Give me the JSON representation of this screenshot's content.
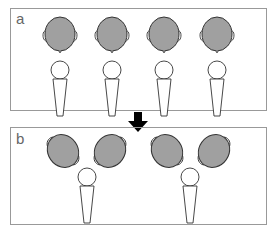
{
  "panels": [
    {
      "label": "a",
      "description": "Four heads with microphones directly below each"
    },
    {
      "label": "b",
      "description": "Two pairs of heads angled toward a shared microphone"
    }
  ],
  "arrow": {
    "direction": "down",
    "color": "#000000"
  },
  "colors": {
    "head_fill": "#a0a0a0",
    "stroke": "#333333",
    "frame": "#999999",
    "label": "#666666"
  }
}
